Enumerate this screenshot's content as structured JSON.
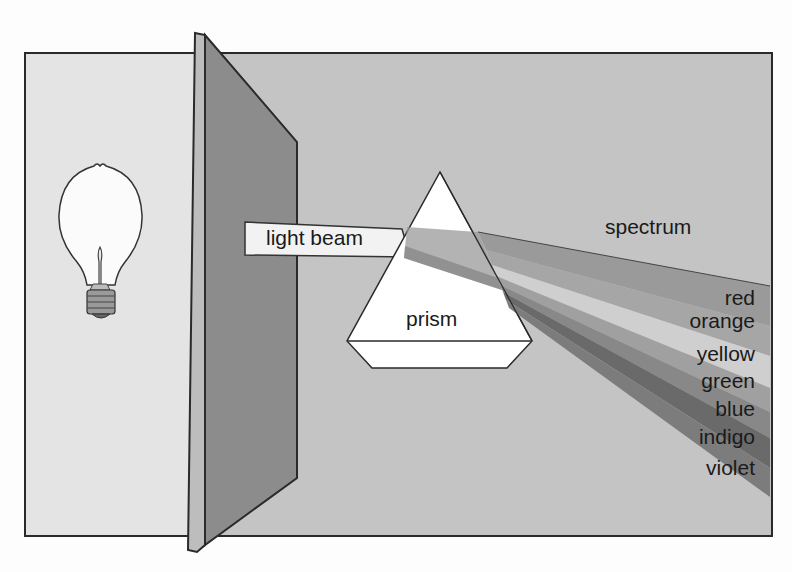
{
  "diagram": {
    "labels": {
      "light_beam": "light beam",
      "prism": "prism",
      "spectrum": "spectrum"
    },
    "spectrum_colors": [
      {
        "name": "red",
        "shade": "#9a9a9a"
      },
      {
        "name": "orange",
        "shade": "#a6a6a6"
      },
      {
        "name": "yellow",
        "shade": "#c9c9c9"
      },
      {
        "name": "green",
        "shade": "#a0a0a0"
      },
      {
        "name": "blue",
        "shade": "#8a8a8a"
      },
      {
        "name": "indigo",
        "shade": "#6e6e6e"
      },
      {
        "name": "violet",
        "shade": "#7a7a7a"
      }
    ],
    "colors": {
      "background_panel": "#c4c4c4",
      "left_panel": "#e4e4e4",
      "screen": "#8c8c8c",
      "screen_edge": "#bdbdbd",
      "prism": "#ffffff",
      "outline": "#2a2a2a"
    }
  }
}
